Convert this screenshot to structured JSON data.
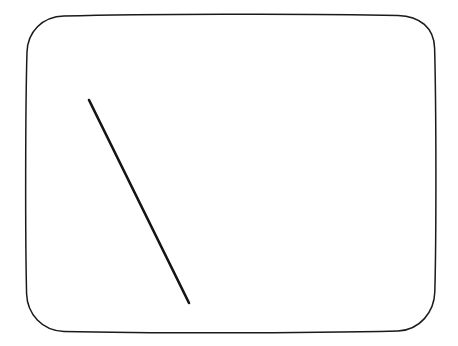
{
  "document": {
    "title": "Sketch Figure",
    "type": "line-drawing",
    "canvas": {
      "width": 458,
      "height": 346,
      "background_color": "#ffffff"
    }
  },
  "drawing": {
    "description": "Hand-drawn rounded rectangle frame containing a single diagonal line",
    "shapes": [
      {
        "id": "frame",
        "name": "rounded-rectangle-frame",
        "kind": "rounded-rectangle",
        "stroke_color": "#1a1a1a",
        "stroke_width": 1.5,
        "fill": "none",
        "bounds": {
          "x": 26,
          "y": 14,
          "width": 410,
          "height": 319
        },
        "corner_radius_top": 38,
        "corner_radius_bottom": 32,
        "path": "M 64 16 C 140 14.2 300 13.4 398 15.4 C 420 16 434 28 434.6 48 C 436.2 104 436.4 236 434.8 292 C 434.2 312 420 330 398 331 C 300 333.4 140 333.2 64 331.4 C 42 330.8 27.4 314 26.6 294 C 25.2 238 25.4 106 27 52 C 27.6 32 42 16.6 64 16 Z"
      },
      {
        "id": "diagonal",
        "name": "diagonal-stroke",
        "kind": "line",
        "stroke_color": "#141414",
        "stroke_width": 2.6,
        "start": {
          "x": 89,
          "y": 100
        },
        "end": {
          "x": 189,
          "y": 303
        },
        "path": "M 89 100 L 189 303"
      }
    ]
  }
}
